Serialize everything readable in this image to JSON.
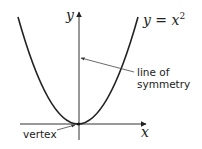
{
  "diagram": {
    "type": "parabola-graph",
    "equation_label": {
      "prefix": "y = x",
      "exponent": "2"
    },
    "x_axis_label": "x",
    "y_axis_label": "y",
    "annotations": {
      "line_of_symmetry_line1": "line of",
      "line_of_symmetry_line2": "symmetry",
      "vertex": "vertex"
    },
    "colors": {
      "stroke": "#222222",
      "axis": "#333333",
      "pointer": "#555555",
      "background": "#ffffff"
    }
  }
}
